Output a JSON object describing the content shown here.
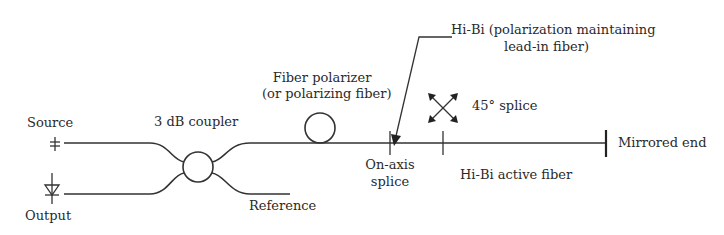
{
  "diagram": {
    "type": "fiber-optic-gyroscope-schematic",
    "labels": {
      "source": "Source",
      "output": "Output",
      "coupler": "3 dB coupler",
      "reference": "Reference",
      "polarizer_line1": "Fiber polarizer",
      "polarizer_line2": "(or polarizing fiber)",
      "hibi_lead_line1": "Hi-Bi (polarization maintaining",
      "hibi_lead_line2": "lead-in fiber)",
      "splice_45": "45° splice",
      "on_axis_line1": "On-axis",
      "on_axis_line2": "splice",
      "active_fiber": "Hi-Bi active fiber",
      "mirrored_end": "Mirrored end"
    },
    "icons": {
      "source": "source-symbol-icon",
      "detector": "photodiode-icon",
      "coupler": "coupler-circle-icon",
      "polarizer": "fiber-loop-icon",
      "rotation": "cross-arrows-icon"
    },
    "colors": {
      "line": "#333333",
      "text": "#2a2a2a",
      "background": "#ffffff"
    }
  }
}
